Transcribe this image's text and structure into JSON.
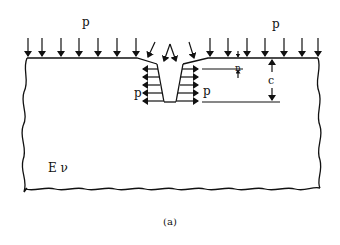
{
  "diagram": {
    "labels": {
      "surface_pressure_left": "p",
      "surface_pressure_right": "p",
      "crack_pressure_left": "p",
      "crack_pressure_right": "p",
      "dimension_n": "n",
      "dimension_c": "c",
      "material": "E ν"
    },
    "caption": "(a)",
    "colors": {
      "ink": "#111111",
      "background": "#ffffff"
    }
  }
}
